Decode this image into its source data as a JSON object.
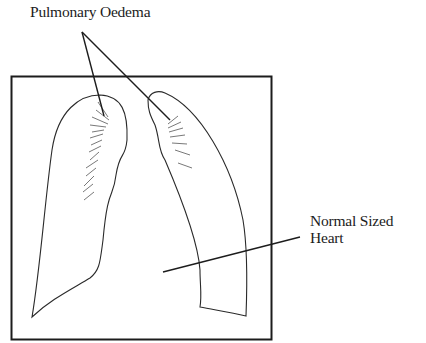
{
  "diagram": {
    "type": "medical-illustration",
    "labels": {
      "pulmonary_oedema": "Pulmonary Oedema",
      "heart_line1": "Normal Sized",
      "heart_line2": "Heart"
    },
    "colors": {
      "ink": "#1c1c1c",
      "background": "#ffffff"
    },
    "frame": {
      "x": 11,
      "y": 76,
      "width": 261,
      "height": 264
    },
    "pointers": {
      "oedema_origin": [
        82,
        32
      ],
      "oedema_targets": [
        [
          105,
          114
        ],
        [
          170,
          120
        ]
      ],
      "heart_line": [
        [
          163,
          272
        ],
        [
          300,
          237
        ]
      ]
    }
  }
}
